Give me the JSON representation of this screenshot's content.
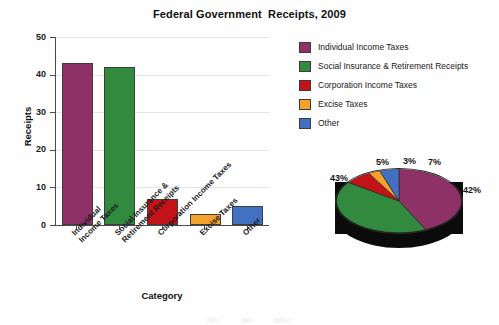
{
  "chart_data": [
    {
      "type": "bar",
      "title": "Federal Government  Receipts, 2009",
      "xlabel": "Category",
      "ylabel": "Receipts",
      "categories": [
        "Individual\nIncome Taxes",
        "Social Insurance &\nRetirement Receipts",
        "Corporation Income Taxes",
        "Excise Taxes",
        "Other"
      ],
      "values": [
        43,
        42,
        7,
        3,
        5
      ],
      "colors": [
        "#8E3166",
        "#328A3F",
        "#C41318",
        "#F5A22D",
        "#4271C2"
      ],
      "ylim": [
        0,
        50
      ],
      "yticks": [
        0,
        10,
        20,
        30,
        40,
        50
      ],
      "ytick_labels": [
        "0",
        "10",
        "20",
        "30",
        "40",
        "50"
      ],
      "grid": "horizontal",
      "legend_position": "right"
    },
    {
      "type": "pie",
      "title": "",
      "categories": [
        "Individual Income Taxes",
        "Social Insurance & Retirement Receipts",
        "Corporation Income Taxes",
        "Excise Taxes",
        "Other"
      ],
      "values": [
        43,
        42,
        7,
        3,
        5
      ],
      "labels": [
        "43%",
        "42%",
        "7%",
        "3%",
        "5%"
      ],
      "colors": [
        "#8E3166",
        "#328A3F",
        "#C41318",
        "#F5A22D",
        "#4271C2"
      ],
      "style": "3d-exploded-none",
      "legend_position": "shared-right"
    }
  ],
  "title": {
    "text": "Federal Government  Receipts, 2009"
  },
  "axes": {
    "y": {
      "label": "Receipts",
      "ticks": [
        {
          "value": 50,
          "label": "50"
        },
        {
          "value": 40,
          "label": "40"
        },
        {
          "value": 30,
          "label": "30"
        },
        {
          "value": 20,
          "label": "20"
        },
        {
          "value": 10,
          "label": "10"
        },
        {
          "value": 0,
          "label": "0"
        }
      ]
    },
    "x": {
      "label": "Category",
      "ticks": [
        {
          "line1": "Individual",
          "line2": "Income Taxes"
        },
        {
          "line1": "Social Insurance &",
          "line2": "Retirement Receipts"
        },
        {
          "line1": "Corporation Income Taxes",
          "line2": ""
        },
        {
          "line1": "Excise Taxes",
          "line2": ""
        },
        {
          "line1": "Other",
          "line2": ""
        }
      ]
    }
  },
  "bars": [
    {
      "category": "Individual Income Taxes",
      "value": 43,
      "color": "#8E3166"
    },
    {
      "category": "Social Insurance & Retirement Receipts",
      "value": 42,
      "color": "#328A3F"
    },
    {
      "category": "Corporation Income Taxes",
      "value": 7,
      "color": "#C41318"
    },
    {
      "category": "Excise Taxes",
      "value": 3,
      "color": "#F5A22D"
    },
    {
      "category": "Other",
      "value": 5,
      "color": "#4271C2"
    }
  ],
  "legend": {
    "items": [
      {
        "label": "Individual Income Taxes",
        "color": "#8E3166"
      },
      {
        "label": "Social Insurance & Retirement Receipts",
        "color": "#328A3F"
      },
      {
        "label": "Corporation Income Taxes",
        "color": "#C41318"
      },
      {
        "label": "Excise Taxes",
        "color": "#F5A22D"
      },
      {
        "label": "Other",
        "color": "#4271C2"
      }
    ]
  },
  "pie": {
    "slices": [
      {
        "label": "43%",
        "value": 43,
        "color": "#8E3166",
        "category": "Individual Income Taxes"
      },
      {
        "label": "42%",
        "value": 42,
        "color": "#328A3F",
        "category": "Social Insurance & Retirement Receipts"
      },
      {
        "label": "7%",
        "value": 7,
        "color": "#C41318",
        "category": "Corporation Income Taxes"
      },
      {
        "label": "3%",
        "value": 3,
        "color": "#F5A22D",
        "category": "Excise Taxes"
      },
      {
        "label": "5%",
        "value": 5,
        "color": "#4271C2",
        "category": "Other"
      }
    ],
    "side_color": "#0b0b0b"
  }
}
